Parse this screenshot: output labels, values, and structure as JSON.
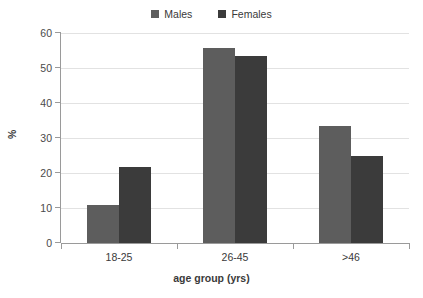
{
  "chart_data": {
    "type": "bar",
    "title": "",
    "xlabel": "age group (yrs)",
    "ylabel": "%",
    "categories": [
      "18-25",
      "26-45",
      ">46"
    ],
    "series": [
      {
        "name": "Males",
        "values": [
          10.7,
          55.5,
          33.4
        ],
        "color": "#5d5d5d"
      },
      {
        "name": "Females",
        "values": [
          21.7,
          53.3,
          24.6
        ],
        "color": "#3b3b3b"
      }
    ],
    "ylim": [
      0,
      60
    ],
    "ytick_step": 10,
    "yticks": [
      0,
      10,
      20,
      30,
      40,
      50,
      60
    ],
    "ytick_labels": [
      "0",
      "10",
      "20",
      "30",
      "40",
      "50",
      "60"
    ],
    "grid": true,
    "grid_axis": "y",
    "legend_position": "top-center",
    "legend_entries": [
      "Males",
      "Females"
    ]
  },
  "legend": {
    "items": [
      {
        "label": "Males",
        "swatch_name": "legend-swatch-males"
      },
      {
        "label": "Females",
        "swatch_name": "legend-swatch-females"
      }
    ]
  },
  "axes": {
    "y": {
      "title": "%",
      "labels": [
        "60",
        "50",
        "40",
        "30",
        "20",
        "10",
        "0"
      ]
    },
    "x": {
      "title": "age group (yrs)",
      "labels": [
        "18-25",
        "26-45",
        ">46"
      ]
    }
  },
  "colors": {
    "males": "#5d5d5d",
    "females": "#3b3b3b",
    "gridline": "#e2e2e2",
    "axis": "#9a9a9a",
    "text": "#3a3a3a",
    "background": "#ffffff"
  }
}
